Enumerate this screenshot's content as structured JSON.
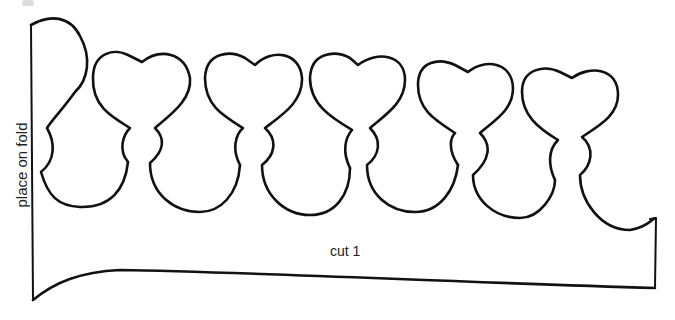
{
  "template": {
    "title": "paper crown cut-out template",
    "labels": {
      "fold": "place on fold",
      "cut": "cut 1"
    },
    "shape_count": 6,
    "line_color": "#111111",
    "background_color": "#ffffff"
  }
}
